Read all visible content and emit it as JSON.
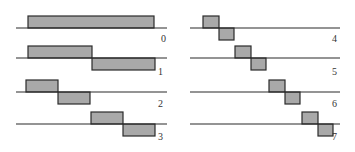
{
  "colors": {
    "bar_fill": "#a9a9a9",
    "stroke": "#2b2b2b",
    "background": "#ffffff"
  },
  "functions": [
    {
      "label": "0",
      "column": "left",
      "line": {
        "x1": 16,
        "x2": 167,
        "y": 28
      },
      "label_pos": {
        "x": 161,
        "y": 42
      },
      "segments": [
        {
          "x": 28,
          "w": 126,
          "dir": "up"
        }
      ]
    },
    {
      "label": "1",
      "column": "left",
      "line": {
        "x1": 16,
        "x2": 167,
        "y": 58
      },
      "label_pos": {
        "x": 158,
        "y": 75
      },
      "segments": [
        {
          "x": 28,
          "w": 64,
          "dir": "up"
        },
        {
          "x": 92,
          "w": 63,
          "dir": "down"
        }
      ]
    },
    {
      "label": "2",
      "column": "left",
      "line": {
        "x1": 16,
        "x2": 167,
        "y": 92
      },
      "label_pos": {
        "x": 158,
        "y": 107
      },
      "segments": [
        {
          "x": 26,
          "w": 32,
          "dir": "up"
        },
        {
          "x": 58,
          "w": 32,
          "dir": "down"
        }
      ]
    },
    {
      "label": "3",
      "column": "left",
      "line": {
        "x1": 16,
        "x2": 167,
        "y": 124
      },
      "label_pos": {
        "x": 158,
        "y": 140
      },
      "segments": [
        {
          "x": 91,
          "w": 32,
          "dir": "up"
        },
        {
          "x": 123,
          "w": 32,
          "dir": "down"
        }
      ]
    },
    {
      "label": "4",
      "column": "right",
      "line": {
        "x1": 190,
        "x2": 340,
        "y": 28
      },
      "label_pos": {
        "x": 332,
        "y": 42
      },
      "segments": [
        {
          "x": 203,
          "w": 16,
          "dir": "up"
        },
        {
          "x": 219,
          "w": 15,
          "dir": "down"
        }
      ]
    },
    {
      "label": "5",
      "column": "right",
      "line": {
        "x1": 190,
        "x2": 340,
        "y": 58
      },
      "label_pos": {
        "x": 332,
        "y": 75
      },
      "segments": [
        {
          "x": 235,
          "w": 16,
          "dir": "up"
        },
        {
          "x": 251,
          "w": 15,
          "dir": "down"
        }
      ]
    },
    {
      "label": "6",
      "column": "right",
      "line": {
        "x1": 190,
        "x2": 340,
        "y": 92
      },
      "label_pos": {
        "x": 332,
        "y": 107
      },
      "segments": [
        {
          "x": 269,
          "w": 16,
          "dir": "up"
        },
        {
          "x": 285,
          "w": 15,
          "dir": "down"
        }
      ]
    },
    {
      "label": "7",
      "column": "right",
      "line": {
        "x1": 190,
        "x2": 340,
        "y": 124
      },
      "label_pos": {
        "x": 332,
        "y": 140
      },
      "segments": [
        {
          "x": 302,
          "w": 16,
          "dir": "up"
        },
        {
          "x": 318,
          "w": 15,
          "dir": "down"
        }
      ]
    }
  ],
  "bar_height": 12
}
